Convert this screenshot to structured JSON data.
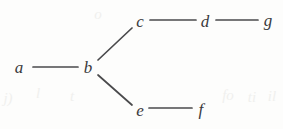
{
  "diagram": {
    "type": "graph",
    "title": "",
    "background_color": "#fdfdfc",
    "edge_color": "#4a4a4c",
    "label_color": "#3a3a3c",
    "nodes": [
      {
        "id": "a",
        "label": "a",
        "x": 19,
        "y": 67
      },
      {
        "id": "b",
        "label": "b",
        "x": 88,
        "y": 67
      },
      {
        "id": "c",
        "label": "c",
        "x": 140,
        "y": 21
      },
      {
        "id": "d",
        "label": "d",
        "x": 205,
        "y": 21
      },
      {
        "id": "g",
        "label": "g",
        "x": 268,
        "y": 20
      },
      {
        "id": "e",
        "label": "e",
        "x": 140,
        "y": 110
      },
      {
        "id": "f",
        "label": "f",
        "x": 201,
        "y": 109
      }
    ],
    "edges": [
      {
        "from": "a",
        "to": "b",
        "x1": 33,
        "y1": 67,
        "x2": 78,
        "y2": 67
      },
      {
        "from": "b",
        "to": "c",
        "x1": 98,
        "y1": 60,
        "x2": 132,
        "y2": 28
      },
      {
        "from": "b",
        "to": "e",
        "x1": 98,
        "y1": 75,
        "x2": 132,
        "y2": 105
      },
      {
        "from": "c",
        "to": "d",
        "x1": 150,
        "y1": 20,
        "x2": 196,
        "y2": 20
      },
      {
        "from": "d",
        "to": "g",
        "x1": 216,
        "y1": 20,
        "x2": 258,
        "y2": 20
      },
      {
        "from": "e",
        "to": "f",
        "x1": 149,
        "y1": 108,
        "x2": 192,
        "y2": 108
      }
    ],
    "artifacts": [
      {
        "text": "j)",
        "x": 8,
        "y": 98
      },
      {
        "text": "l",
        "x": 38,
        "y": 93
      },
      {
        "text": "t",
        "x": 72,
        "y": 96
      },
      {
        "text": "fo",
        "x": 228,
        "y": 95
      },
      {
        "text": "ti",
        "x": 252,
        "y": 97
      },
      {
        "text": "il",
        "x": 272,
        "y": 96
      },
      {
        "text": "o",
        "x": 98,
        "y": 14
      }
    ]
  }
}
